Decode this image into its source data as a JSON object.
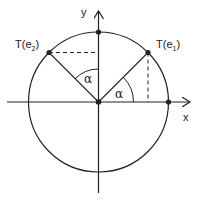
{
  "diagram": {
    "axes": {
      "x_label": "x",
      "y_label": "y"
    },
    "points": [
      {
        "id": "origin",
        "label": ""
      },
      {
        "id": "T_e1",
        "label": "T(e",
        "sub": "1",
        "close": ")"
      },
      {
        "id": "T_e2",
        "label": "T(e",
        "sub": "2",
        "close": ")"
      },
      {
        "id": "e1",
        "label": ""
      },
      {
        "id": "e2",
        "label": ""
      }
    ],
    "angles": [
      {
        "id": "angle-e1",
        "label": "α"
      },
      {
        "id": "angle-e2",
        "label": "α"
      }
    ],
    "colors": {
      "stroke": "#222222",
      "background": "#ffffff"
    }
  }
}
